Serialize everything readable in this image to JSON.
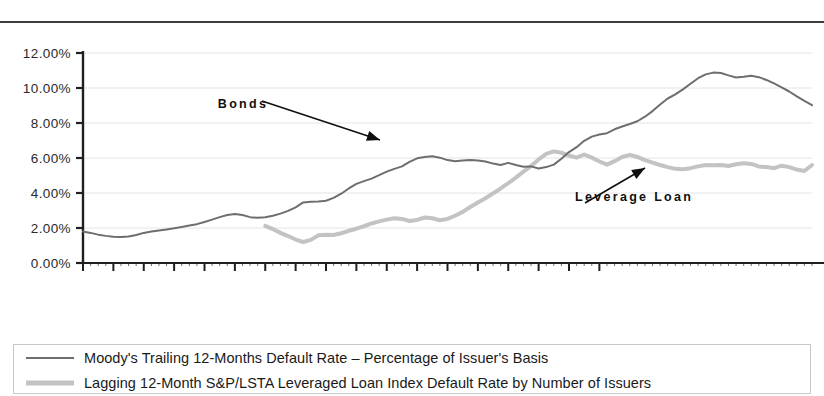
{
  "chart_data": {
    "type": "line",
    "title": "",
    "xlabel": "",
    "ylabel": "",
    "ylim": [
      0,
      12
    ],
    "ytick_labels": [
      "12.00%",
      "10.00%",
      "8.00%",
      "6.00%",
      "4.00%",
      "2.00%",
      "0.00%"
    ],
    "ytick_values": [
      12,
      10,
      8,
      6,
      4,
      2,
      0
    ],
    "grid": true,
    "legend_position": "below-plot",
    "x_tick_labels": [
      "Jan-97",
      "May-97",
      "Sep-97",
      "Jan-98",
      "May-98",
      "Sep-98",
      "Jan-99",
      "May-99",
      "Sep-99",
      "Jan-00",
      "May-00",
      "Sep-00",
      "Jan-01",
      "May-01",
      "Sep-01",
      "Jan-02",
      "May-02",
      "Sep-02"
    ],
    "x_start": "Jan-97",
    "x_end": "Nov-02",
    "x_step_months": 1,
    "x_tick_step_months": 4,
    "annotations": [
      {
        "text": "Bonds",
        "x_frac": 0.185,
        "y_value": 8.85
      },
      {
        "text": "Leverage Loan",
        "x_frac": 0.675,
        "y_value": 3.55
      }
    ],
    "series": [
      {
        "name": "Moody's Trailing 12-Months Default Rate – Percentage of Issuer's Basis",
        "short_name": "Bonds",
        "color": "#6e6e6e",
        "width": 2,
        "start_index": 0,
        "values": [
          1.8,
          1.72,
          1.62,
          1.55,
          1.5,
          1.48,
          1.52,
          1.6,
          1.72,
          1.8,
          1.86,
          1.92,
          1.98,
          2.06,
          2.14,
          2.22,
          2.34,
          2.48,
          2.62,
          2.74,
          2.8,
          2.74,
          2.62,
          2.58,
          2.62,
          2.7,
          2.82,
          2.98,
          3.18,
          3.46,
          3.5,
          3.52,
          3.56,
          3.72,
          3.96,
          4.26,
          4.52,
          4.68,
          4.82,
          5.02,
          5.22,
          5.38,
          5.52,
          5.78,
          5.98,
          6.06,
          6.1,
          6.02,
          5.88,
          5.82,
          5.86,
          5.88,
          5.86,
          5.8,
          5.68,
          5.6,
          5.72,
          5.6,
          5.5,
          5.52,
          5.4,
          5.48,
          5.62,
          5.96,
          6.34,
          6.62,
          6.98,
          7.22,
          7.34,
          7.42,
          7.64,
          7.8,
          7.94,
          8.1,
          8.36,
          8.68,
          9.06,
          9.4,
          9.64,
          9.92,
          10.24,
          10.56,
          10.78,
          10.88,
          10.86,
          10.72,
          10.6,
          10.64,
          10.7,
          10.62,
          10.46,
          10.26,
          10.04,
          9.8,
          9.52,
          9.26,
          9.02
        ]
      },
      {
        "name": "Lagging 12-Month S&P/LSTA Leveraged Loan Index Default Rate by Number of Issuers",
        "short_name": "Leverage Loan",
        "color": "#c3c3c3",
        "width": 4,
        "start_index": 24,
        "values": [
          2.12,
          1.94,
          1.72,
          1.54,
          1.34,
          1.2,
          1.32,
          1.58,
          1.62,
          1.6,
          1.7,
          1.84,
          1.96,
          2.1,
          2.26,
          2.38,
          2.48,
          2.56,
          2.52,
          2.4,
          2.46,
          2.6,
          2.56,
          2.44,
          2.52,
          2.7,
          2.92,
          3.2,
          3.46,
          3.7,
          3.98,
          4.26,
          4.56,
          4.88,
          5.22,
          5.54,
          5.92,
          6.24,
          6.38,
          6.3,
          6.14,
          6.02,
          6.2,
          6.02,
          5.8,
          5.62,
          5.82,
          6.06,
          6.18,
          6.06,
          5.88,
          5.74,
          5.6,
          5.48,
          5.38,
          5.36,
          5.42,
          5.52,
          5.6,
          5.58,
          5.6,
          5.54,
          5.64,
          5.7,
          5.66,
          5.52,
          5.48,
          5.42,
          5.56,
          5.48,
          5.34,
          5.26,
          5.6
        ]
      }
    ]
  },
  "legend": {
    "items": [
      {
        "label": "Moody's Trailing 12-Months Default Rate – Percentage of Issuer's Basis",
        "swatch": "thin-gray-line"
      },
      {
        "label": "Lagging 12-Month S&P/LSTA Leveraged Loan Index Default Rate by Number of Issuers",
        "swatch": "thick-light-gray-line"
      }
    ]
  },
  "colors": {
    "bonds_line": "#6e6e6e",
    "loan_line": "#c3c3c3",
    "axis": "#1f1f1f",
    "grid": "#e4e4e4",
    "text": "#1a1a1a"
  }
}
